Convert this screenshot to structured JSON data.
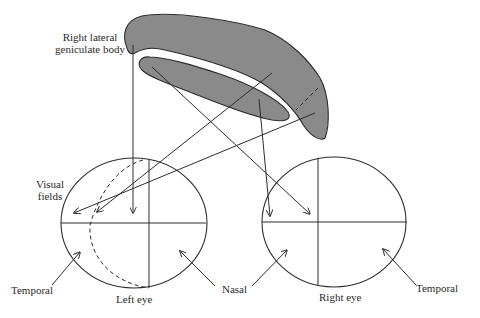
{
  "diagram": {
    "labels": {
      "lgb_line1": "Right lateral",
      "lgb_line2": "geniculate body",
      "visual_fields_line1": "Visual",
      "visual_fields_line2": "fields",
      "temporal_left": "Temporal",
      "left_eye": "Left eye",
      "nasal": "Nasal",
      "right_eye": "Right eye",
      "temporal_right": "Temporal"
    },
    "colors": {
      "band_fill": "#8a8a8a",
      "stroke": "#333333",
      "background": "#ffffff"
    }
  }
}
